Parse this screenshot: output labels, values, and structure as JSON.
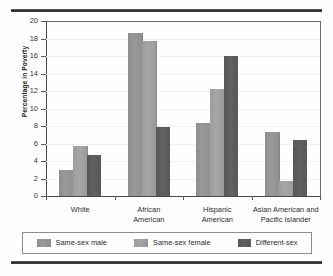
{
  "chart_data": {
    "type": "bar",
    "title": "",
    "xlabel": "",
    "ylabel": "Percentage in Poverty",
    "ylim": [
      0,
      20
    ],
    "ytick_step": 2,
    "yticks": [
      "20",
      "18",
      "16",
      "14",
      "12",
      "10",
      "8",
      "6",
      "4",
      "2",
      "0"
    ],
    "grid": false,
    "legend_position": "bottom",
    "categories": [
      "White",
      "African American",
      "Hispanic American",
      "Asian American and Pacific Islander"
    ],
    "category_lines": [
      [
        "White"
      ],
      [
        "African",
        "American"
      ],
      [
        "Hispanic",
        "American"
      ],
      [
        "Asian American and",
        "Pacific Islander"
      ]
    ],
    "series": [
      {
        "name": "Same-sex male",
        "color": "#949494",
        "values": [
          3.0,
          18.6,
          8.3,
          7.3
        ]
      },
      {
        "name": "Same-sex female",
        "color": "#a2a2a2",
        "values": [
          5.7,
          17.7,
          12.2,
          1.7
        ]
      },
      {
        "name": "Different-sex",
        "color": "#5c5c5c",
        "values": [
          4.7,
          7.9,
          16.0,
          6.4
        ]
      }
    ]
  },
  "legend": {
    "items": [
      {
        "label": "Same-sex male"
      },
      {
        "label": "Same-sex female"
      },
      {
        "label": "Different-sex"
      }
    ]
  }
}
